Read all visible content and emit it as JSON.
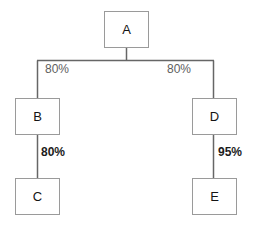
{
  "diagram": {
    "type": "tree",
    "title": "",
    "colors": {
      "node_border": "#9a9a9a",
      "node_fill": "#ffffff",
      "edge_line": "#666666",
      "label_upper": "#5e5e5e",
      "label_lower": "#1c1c1c",
      "background": "#ffffff"
    },
    "nodes": [
      {
        "id": "A",
        "label": "A",
        "x": 104,
        "y": 11,
        "w": 45,
        "h": 37
      },
      {
        "id": "B",
        "label": "B",
        "x": 15,
        "y": 98,
        "w": 45,
        "h": 37
      },
      {
        "id": "D",
        "label": "D",
        "x": 192,
        "y": 98,
        "w": 45,
        "h": 37
      },
      {
        "id": "C",
        "label": "C",
        "x": 15,
        "y": 178,
        "w": 45,
        "h": 37
      },
      {
        "id": "E",
        "label": "E",
        "x": 192,
        "y": 178,
        "w": 45,
        "h": 37
      }
    ],
    "edges": [
      {
        "from": "A",
        "to": "B",
        "label": "80%",
        "style": "upper"
      },
      {
        "from": "A",
        "to": "D",
        "label": "80%",
        "style": "upper"
      },
      {
        "from": "B",
        "to": "C",
        "label": "80%",
        "style": "lower"
      },
      {
        "from": "D",
        "to": "E",
        "label": "95%",
        "style": "lower"
      }
    ],
    "edge_labels": [
      {
        "text": "80%",
        "style": "upper",
        "x": 45,
        "y": 63
      },
      {
        "text": "80%",
        "style": "upper",
        "x": 167,
        "y": 63
      },
      {
        "text": "80%",
        "style": "lower",
        "x": 41,
        "y": 146
      },
      {
        "text": "95%",
        "style": "lower",
        "x": 218,
        "y": 146
      }
    ]
  }
}
